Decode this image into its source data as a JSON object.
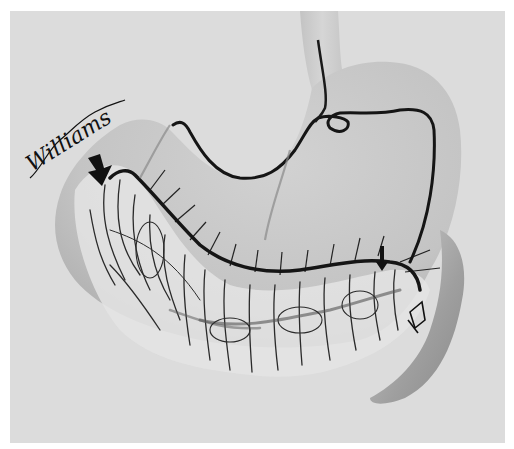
{
  "figure": {
    "subject": "Stomach with gastroepiploic arterial arcade and omental vessels",
    "style": "grayscale pencil/ink anatomical illustration",
    "signature": "Williams",
    "colors": {
      "page_border": "#ffffff",
      "background": "#dcdcdc",
      "stomach_fill": "#c9c9c9",
      "stomach_shadow": "#a8a8a8",
      "vessel": "#1a1a1a",
      "omentum_light": "#eeeeee"
    },
    "annotations": [
      {
        "id": "arrow-large",
        "type": "solid-arrow",
        "description": "large black arrow pointing at upper greater curvature (left)"
      },
      {
        "id": "arrow-small",
        "type": "solid-arrow",
        "description": "small black arrow on right gastroepiploic vessel near pylorus"
      },
      {
        "id": "arrow-open",
        "type": "open-arrow",
        "description": "hollow outlined arrow pointing toward pylorus/duodenum"
      }
    ],
    "structures": [
      "esophagus",
      "fundus",
      "body of stomach",
      "lesser curvature artery",
      "gastroepiploic arcade along greater curvature",
      "greater omentum vessels",
      "pylorus / duodenum"
    ]
  }
}
